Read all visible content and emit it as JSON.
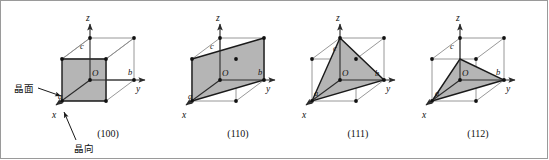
{
  "figure": {
    "background": "#ffffff",
    "plane_fill": "#b5b5b5",
    "plane_stroke": "#1a1a1a",
    "cube_edge_color": "#8c8c8c",
    "axis_color": "#2b2b2b",
    "vertex_color": "#111111",
    "annotations": [
      {
        "id": "crystal-plane",
        "label": "晶面",
        "meaning": "crystal plane",
        "x": 14,
        "y": 88
      },
      {
        "id": "crystal-direction",
        "label": "晶向",
        "meaning": "crystal direction",
        "x": 78,
        "y": 147
      }
    ],
    "axis_labels": {
      "x": "x",
      "y": "y",
      "z": "z"
    },
    "point_labels": {
      "origin": "O",
      "a": "a",
      "b": "b",
      "c": "c"
    },
    "cells": [
      {
        "index": 0,
        "caption": "(100)",
        "caption_x": 108,
        "caption_y": 137,
        "origin_x": 90,
        "origin_y": 80,
        "plane_type": "square-front-face",
        "intercepts": {
          "x": 1,
          "y": "∞",
          "z": "∞"
        },
        "has_leader_lines": true
      },
      {
        "index": 1,
        "caption": "(110)",
        "caption_x": 238,
        "caption_y": 137,
        "origin_x": 220,
        "origin_y": 80,
        "plane_type": "diagonal-rectangle",
        "intercepts": {
          "x": 1,
          "y": 1,
          "z": "∞"
        },
        "has_leader_lines": false
      },
      {
        "index": 2,
        "caption": "(111)",
        "caption_x": 358,
        "caption_y": 137,
        "origin_x": 340,
        "origin_y": 80,
        "plane_type": "triangle-abc",
        "intercepts": {
          "x": 1,
          "y": 1,
          "z": 1
        },
        "has_leader_lines": false
      },
      {
        "index": 3,
        "caption": "(112)",
        "caption_x": 478,
        "caption_y": 137,
        "origin_x": 460,
        "origin_y": 80,
        "plane_type": "triangle-half-c",
        "intercepts": {
          "x": 1,
          "y": 1,
          "z": 0.5
        },
        "has_leader_lines": false
      }
    ]
  }
}
